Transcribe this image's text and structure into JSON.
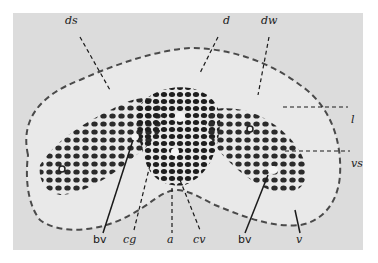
{
  "figure": {
    "colors": {
      "background": "#dcdcdc",
      "tissue": "#e9e9e9",
      "nuclei": "#2b2b2b",
      "border": "#ffffff"
    },
    "labels": {
      "ds": "ds",
      "d": "d",
      "dw": "dw",
      "l": "l",
      "vs": "vs",
      "bv_left": "bv",
      "cg": "cg",
      "a": "a",
      "cv": "cv",
      "bv_right": "bv",
      "v": "v"
    }
  }
}
